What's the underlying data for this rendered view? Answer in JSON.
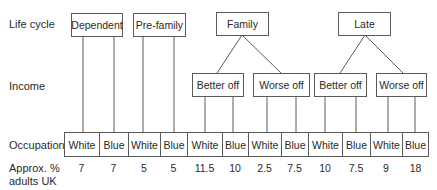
{
  "row_labels": {
    "life_cycle": "Life cycle",
    "income": "Income",
    "occupation": "Occupation",
    "approx_line1": "Approx. %",
    "approx_line2": "adults UK"
  },
  "life_cycle": [
    {
      "label": "Dependent"
    },
    {
      "label": "Pre-family"
    },
    {
      "label": "Family"
    },
    {
      "label": "Late"
    }
  ],
  "income": [
    {
      "label": "Better off",
      "parent": "Family"
    },
    {
      "label": "Worse off",
      "parent": "Family"
    },
    {
      "label": "Better off",
      "parent": "Late"
    },
    {
      "label": "Worse off",
      "parent": "Late"
    }
  ],
  "occupation": [
    {
      "label": "White",
      "value": "7"
    },
    {
      "label": "Blue",
      "value": "7"
    },
    {
      "label": "White",
      "value": "5"
    },
    {
      "label": "Blue",
      "value": "5"
    },
    {
      "label": "White",
      "value": "11.5"
    },
    {
      "label": "Blue",
      "value": "10"
    },
    {
      "label": "White",
      "value": "2.5"
    },
    {
      "label": "Blue",
      "value": "7.5"
    },
    {
      "label": "White",
      "value": "10"
    },
    {
      "label": "Blue",
      "value": "7.5"
    },
    {
      "label": "White",
      "value": "9"
    },
    {
      "label": "Blue",
      "value": "18"
    }
  ]
}
